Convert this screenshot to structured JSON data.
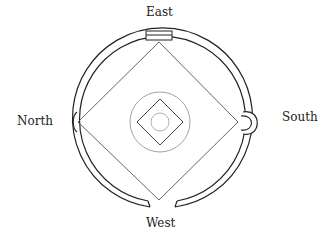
{
  "diagram": {
    "type": "compass-plan",
    "labels": {
      "east": "East",
      "north": "North",
      "south": "South",
      "west": "West"
    },
    "colors": {
      "stroke": "#222222",
      "light_stroke": "#888888",
      "background": "#ffffff"
    }
  }
}
